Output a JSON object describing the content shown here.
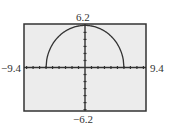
{
  "window": {
    "xmin": "-9.4",
    "xmax": "9.4",
    "ymin": "-6.2",
    "ymax": "6.2",
    "xscl": 1,
    "yscl": 1
  },
  "colors": {
    "screen_bg": "#ececec",
    "frame": "#333333",
    "axis": "#333333",
    "curve": "#333333",
    "page_bg": "#ffffff"
  },
  "chart_data": {
    "type": "line",
    "title": "",
    "xlabel": "",
    "ylabel": "",
    "xlim": [
      -9.4,
      9.4
    ],
    "ylim": [
      -6.2,
      6.2
    ],
    "grid": false,
    "tick_step_x": 1,
    "tick_step_y": 1,
    "tick_labels": {
      "left": "-9.4",
      "right": "9.4",
      "top": "6.2",
      "bottom": "-6.2"
    },
    "series": [
      {
        "name": "y = sqrt(36 - x^2)",
        "description": "upper semicircle of radius 6 centered at origin",
        "x": [
          -6,
          -5.5,
          -5,
          -4,
          -3,
          -2,
          -1,
          0,
          1,
          2,
          3,
          4,
          5,
          5.5,
          6
        ],
        "y": [
          0,
          2.4,
          3.32,
          4.47,
          5.2,
          5.66,
          5.92,
          6,
          5.92,
          5.66,
          5.2,
          4.47,
          3.32,
          2.4,
          0
        ]
      }
    ]
  }
}
